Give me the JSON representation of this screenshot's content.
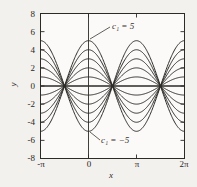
{
  "chart_data": {
    "type": "line",
    "title": "",
    "subtitle": "",
    "xlabel": "x",
    "ylabel": "y",
    "xlim": [
      -3.14159265,
      6.28318531
    ],
    "ylim": [
      -8,
      8
    ],
    "grid": false,
    "legend": false,
    "legend_position": "none",
    "xticks": [
      -3.14159265,
      0,
      3.14159265,
      6.28318531
    ],
    "xticklabels": [
      "-π",
      "0",
      "π",
      "2π"
    ],
    "yticks": [
      -8,
      -6,
      -4,
      -2,
      0,
      2,
      4,
      6,
      8
    ],
    "yticklabels": [
      "-8",
      "-6",
      "-4",
      "-2",
      "0",
      "2",
      "4",
      "6",
      "8"
    ],
    "curve_color": "#2d2a27",
    "axis_color": "#2d2a27",
    "background_color": "#f3f1ee",
    "node_x": [
      -1.57079633,
      1.57079633,
      4.71238898
    ],
    "series": [
      {
        "name": "c1 = 5",
        "c1": 5,
        "amplitude_at_x0": 5
      },
      {
        "name": "c1 = 4",
        "c1": 4,
        "amplitude_at_x0": 4
      },
      {
        "name": "c1 = 3",
        "c1": 3,
        "amplitude_at_x0": 3
      },
      {
        "name": "c1 = 2",
        "c1": 2,
        "amplitude_at_x0": 2
      },
      {
        "name": "c1 = 1",
        "c1": 1,
        "amplitude_at_x0": 1
      },
      {
        "name": "c1 = 0",
        "c1": 0,
        "amplitude_at_x0": 0
      },
      {
        "name": "c1 = -1",
        "c1": -1,
        "amplitude_at_x0": -1
      },
      {
        "name": "c1 = -2",
        "c1": -2,
        "amplitude_at_x0": -2
      },
      {
        "name": "c1 = -3",
        "c1": -3,
        "amplitude_at_x0": -3
      },
      {
        "name": "c1 = -4",
        "c1": -4,
        "amplitude_at_x0": -4
      },
      {
        "name": "c1 = -5",
        "c1": -5,
        "amplitude_at_x0": -5
      }
    ],
    "annotations": [
      {
        "id": "top",
        "text_prefix": "c",
        "text_sub": "1",
        "text_suffix": " = 5",
        "full_text": "c₁ = 5",
        "point_x": 0,
        "point_y": 5
      },
      {
        "id": "bottom",
        "text_prefix": "c",
        "text_sub": "1",
        "text_suffix": " = −5",
        "full_text": "c₁ = −5",
        "point_x": 0,
        "point_y": -5
      }
    ]
  },
  "axes": {
    "ylabel": "y",
    "xlabel": "x",
    "yticklabels": [
      "8",
      "6",
      "4",
      "2",
      "0",
      "-2",
      "-4",
      "-6",
      "-8"
    ],
    "xticklabels": [
      "-π",
      "0",
      "π",
      "2π"
    ]
  }
}
